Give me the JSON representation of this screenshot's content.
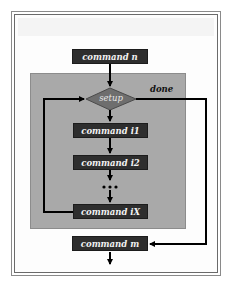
{
  "diagram": {
    "type": "flowchart",
    "nodes": {
      "command_n": "command n",
      "setup": "setup",
      "command_i1": "command i1",
      "command_i2": "command i2",
      "command_iX": "command iX",
      "command_m": "command m"
    },
    "edge_labels": {
      "done": "done"
    },
    "edges": [
      {
        "from": "command n",
        "to": "setup"
      },
      {
        "from": "setup",
        "to": "command i1"
      },
      {
        "from": "command i1",
        "to": "command i2"
      },
      {
        "from": "command i2",
        "to": "ellipsis"
      },
      {
        "from": "ellipsis",
        "to": "command iX"
      },
      {
        "from": "command iX",
        "to": "setup",
        "type": "loop-back"
      },
      {
        "from": "setup",
        "to": "command m",
        "label": "done"
      }
    ],
    "colors": {
      "box_fill": "#2e2e2e",
      "box_text": "#f2f2f2",
      "loop_region": "#a9a9a9",
      "diamond_fill": "#6e6e6e",
      "line": "#000000"
    }
  }
}
